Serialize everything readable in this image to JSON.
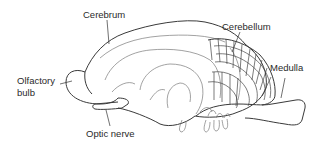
{
  "diagram": {
    "labels": {
      "cerebrum": "Cerebrum",
      "cerebellum": "Cerebellum",
      "medulla": "Medulla",
      "olfactory_bulb_line1": "Olfactory",
      "olfactory_bulb_line2": "bulb",
      "optic_nerve": "Optic nerve"
    },
    "colors": {
      "line": "#3a3a3a",
      "text": "#2a2a2a",
      "background": "#ffffff"
    }
  }
}
